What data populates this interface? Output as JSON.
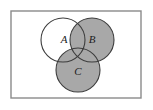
{
  "figure": {
    "shaded_description": "Region B union C is shaded gray; circle A is unshaded white except where it overlaps B or C",
    "background_color": "#ffffff",
    "frame": {
      "name": "universal-set-rectangle",
      "x": 11,
      "y": 11,
      "width": 130,
      "height": 87,
      "stroke_color": "#8a8a8a",
      "fill_color": "#ffffff",
      "stroke_width": 1.4
    },
    "palette": {
      "shaded_fill": "#a8a8a8",
      "unshaded_fill": "#ffffff",
      "circle_stroke": "#3c3c3c",
      "label_color": "#1c1c1c"
    },
    "circles": [
      {
        "id": "A",
        "name": "circle-a",
        "label": "A",
        "cx": 63,
        "cy": 40,
        "r": 22,
        "fill": "#ffffff",
        "shaded": false,
        "label_x": 64,
        "label_y": 40
      },
      {
        "id": "B",
        "name": "circle-b",
        "label": "B",
        "cx": 92,
        "cy": 40,
        "r": 22,
        "fill": "#a8a8a8",
        "shaded": true,
        "label_x": 92,
        "label_y": 40
      },
      {
        "id": "C",
        "name": "circle-c",
        "label": "C",
        "cx": 78,
        "cy": 70,
        "r": 22,
        "fill": "#a8a8a8",
        "shaded": true,
        "label_x": 78,
        "label_y": 72
      }
    ]
  }
}
